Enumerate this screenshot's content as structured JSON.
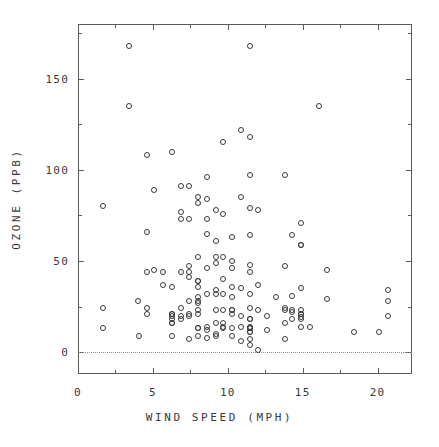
{
  "chart_data": {
    "type": "scatter",
    "title": "",
    "xlabel": "WIND SPEED (MPH)",
    "ylabel": "OZONE (PPB)",
    "xlim": [
      0,
      22.3
    ],
    "ylim": [
      -12,
      180
    ],
    "grid": false,
    "legend": null,
    "marker": "open-circle",
    "marker_color": "#3a3a3a",
    "reference_lines": [
      {
        "axis": "y",
        "value": 0,
        "style": "dotted",
        "color": "#8a8a8a"
      }
    ],
    "x_ticks_major": [
      0,
      5,
      10,
      15,
      20
    ],
    "x_tick_labels": [
      "0",
      "5",
      "10",
      "15",
      "20"
    ],
    "x_ticks_minor": [
      2.5,
      7.5,
      12.5,
      17.5
    ],
    "y_ticks_major": [
      0,
      50,
      100,
      150
    ],
    "y_tick_labels": [
      "0",
      "50",
      "100",
      "150"
    ],
    "y_ticks_minor": [
      25,
      75,
      125,
      175
    ],
    "series": [
      {
        "name": "Ozone vs Wind",
        "x": [
          7.4,
          8.0,
          12.6,
          11.5,
          14.3,
          14.9,
          8.6,
          13.8,
          20.1,
          8.6,
          6.9,
          9.7,
          9.2,
          10.9,
          13.2,
          11.5,
          12.0,
          18.4,
          11.5,
          9.7,
          9.7,
          16.6,
          9.7,
          12.0,
          16.6,
          14.9,
          8.0,
          12.0,
          14.9,
          5.7,
          7.4,
          8.6,
          9.7,
          16.1,
          9.2,
          8.6,
          14.3,
          9.7,
          6.9,
          13.8,
          11.5,
          10.9,
          9.2,
          8.0,
          13.8,
          11.5,
          14.9,
          20.7,
          9.2,
          11.5,
          10.3,
          6.3,
          1.7,
          4.6,
          6.3,
          8.0,
          8.0,
          10.3,
          11.5,
          14.9,
          8.0,
          4.1,
          9.2,
          9.2,
          10.9,
          4.6,
          10.9,
          5.1,
          6.3,
          5.7,
          7.4,
          8.6,
          14.3,
          14.9,
          14.9,
          14.3,
          6.9,
          10.3,
          6.3,
          5.1,
          11.5,
          6.9,
          9.7,
          11.5,
          8.6,
          8.0,
          8.6,
          12.0,
          7.4,
          7.4,
          7.4,
          9.2,
          6.9,
          13.8,
          7.4,
          6.9,
          7.4,
          4.6,
          4.0,
          10.3,
          8.0,
          8.6,
          11.5,
          11.5,
          11.5,
          9.7,
          11.5,
          10.3,
          6.3,
          7.4,
          10.9,
          10.3,
          15.5,
          14.3,
          12.6,
          9.7,
          3.4,
          3.4,
          8.6,
          6.9,
          13.8,
          11.5,
          10.9,
          9.2,
          8.0,
          13.8,
          11.5,
          14.9,
          20.7,
          9.2,
          11.5,
          10.3,
          6.3,
          1.7,
          4.6,
          6.3,
          8.0,
          8.0,
          10.3,
          11.5,
          14.9,
          8.0,
          11.5,
          14.9,
          20.7,
          9.2,
          11.5,
          10.3,
          6.3,
          1.7,
          4.6,
          6.3,
          8.0,
          8.0,
          10.3
        ],
        "y": [
          41,
          36,
          12,
          18,
          23,
          19,
          8,
          16,
          11,
          14,
          18,
          14,
          34,
          6,
          30,
          11,
          1,
          11,
          4,
          32,
          23,
          45,
          115,
          37,
          29,
          71,
          39,
          23,
          21,
          37,
          20,
          12,
          13,
          135,
          49,
          32,
          64,
          40,
          77,
          97,
          97,
          85,
          10,
          27,
          7,
          48,
          35,
          34,
          61,
          79,
          63,
          16,
          80,
          108,
          20,
          52,
          82,
          50,
          64,
          59,
          39,
          9,
          16,
          78,
          35,
          66,
          122,
          89,
          110,
          44,
          28,
          65,
          22,
          59,
          23,
          31,
          44,
          21,
          9,
          45,
          168,
          73,
          76,
          118,
          84,
          85,
          96,
          78,
          73,
          91,
          47,
          32,
          20,
          23,
          21,
          24,
          44,
          21,
          28,
          9,
          13,
          46,
          18,
          13,
          24,
          16,
          13,
          23,
          36,
          7,
          14,
          30,
          14,
          18,
          20,
          52,
          135,
          168,
          73,
          91,
          47,
          32,
          20,
          23,
          21,
          24,
          44,
          21,
          28,
          9,
          13,
          46,
          18,
          13,
          24,
          16,
          13,
          23,
          36,
          7,
          14,
          30,
          14,
          18,
          20,
          52,
          11,
          23,
          21,
          24,
          44,
          21,
          28,
          9,
          13
        ]
      }
    ]
  }
}
